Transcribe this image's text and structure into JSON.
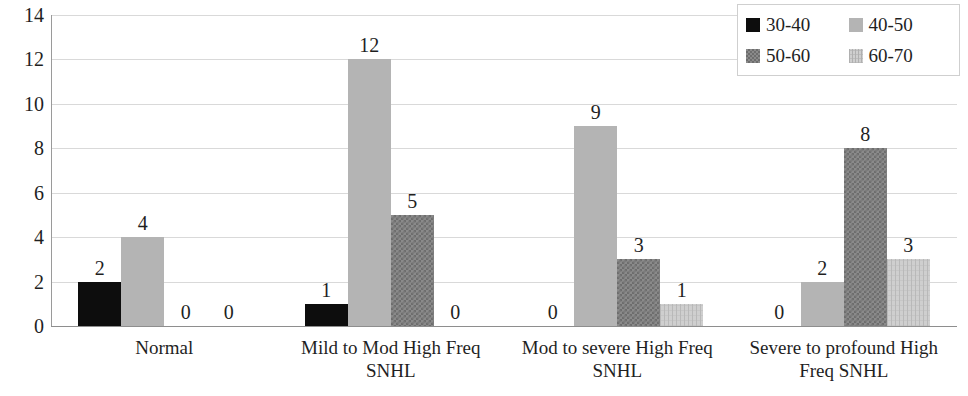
{
  "chart_data": {
    "type": "bar",
    "title": "",
    "subtitle": "",
    "xlabel": "",
    "ylabel": "",
    "ylim": [
      0,
      14
    ],
    "yticks": [
      0,
      2,
      4,
      6,
      8,
      10,
      12,
      14
    ],
    "grid": true,
    "legend_position": "top-right",
    "categories": [
      "Normal",
      "Mild to Mod High Freq SNHL",
      "Mod to severe High Freq SNHL",
      "Severe to profound High Freq SNHL"
    ],
    "series": [
      {
        "name": "30-40",
        "color": "#0d0d0d",
        "values": [
          2,
          1,
          0,
          0
        ]
      },
      {
        "name": "40-50",
        "color": "#b4b4b4",
        "values": [
          4,
          12,
          9,
          2
        ]
      },
      {
        "name": "50-60",
        "color": "#8a8a8a",
        "values": [
          0,
          5,
          3,
          8
        ]
      },
      {
        "name": "60-70",
        "color": "#cfcfcf",
        "values": [
          0,
          0,
          1,
          3
        ]
      }
    ],
    "data_labels": [
      [
        "2",
        "4",
        "0",
        "0"
      ],
      [
        "1",
        "12",
        "5",
        "0"
      ],
      [
        "0",
        "9",
        "3",
        "1"
      ],
      [
        "0",
        "2",
        "8",
        "3"
      ]
    ]
  },
  "axis": {
    "y_tick_labels": [
      "14",
      "12",
      "10",
      "8",
      "6",
      "4",
      "2",
      "0"
    ]
  },
  "legend": {
    "items": [
      {
        "label": "30-40"
      },
      {
        "label": "40-50"
      },
      {
        "label": "50-60"
      },
      {
        "label": "60-70"
      }
    ]
  }
}
